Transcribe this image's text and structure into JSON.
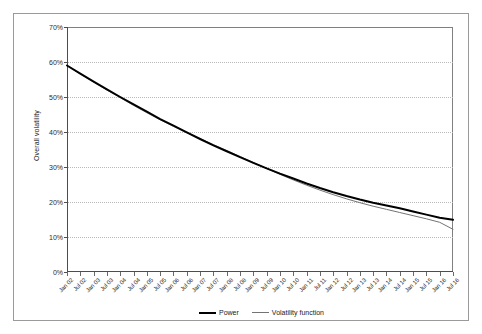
{
  "chart_data": {
    "type": "line",
    "title": "",
    "xlabel": "",
    "ylabel": "Overall volatility",
    "ylim": [
      0,
      0.7
    ],
    "ytick_labels": [
      "0%",
      "10%",
      "20%",
      "30%",
      "40%",
      "50%",
      "60%",
      "70%"
    ],
    "ytick_values": [
      0,
      10,
      20,
      30,
      40,
      50,
      60,
      70
    ],
    "grid": true,
    "legend_position": "bottom-center",
    "categories": [
      "Jan 02",
      "Jul 02",
      "Jan 03",
      "Jul 03",
      "Jan 04",
      "Jul 04",
      "Jan 05",
      "Jul 05",
      "Jan 06",
      "Jul 06",
      "Jan 07",
      "Jul 07",
      "Jan 08",
      "Jul 08",
      "Jan 09",
      "Jul 09",
      "Jan 10",
      "Jul 10",
      "Jan 11",
      "Jul 11",
      "Jan 12",
      "Jul 12",
      "Jan 13",
      "Jul 13",
      "Jan 14",
      "Jul 14",
      "Jan 15",
      "Jul 15",
      "Jan 16",
      "Jul 16"
    ],
    "series": [
      {
        "name": "Power",
        "color": "#000000",
        "width": 2,
        "values": [
          59.0,
          56.7,
          54.4,
          52.2,
          50.0,
          47.9,
          45.8,
          43.7,
          41.8,
          39.9,
          38.0,
          36.2,
          34.5,
          32.8,
          31.2,
          29.6,
          28.1,
          26.7,
          25.3,
          24.0,
          22.8,
          21.7,
          20.7,
          19.8,
          19.0,
          18.2,
          17.3,
          16.4,
          15.5,
          14.9
        ]
      },
      {
        "name": "Volatility function",
        "color": "#737373",
        "width": 1,
        "values": [
          59.0,
          56.6,
          54.3,
          52.0,
          49.8,
          47.6,
          45.5,
          43.5,
          41.6,
          39.8,
          38.1,
          36.4,
          34.7,
          33.0,
          31.3,
          29.6,
          27.9,
          26.3,
          24.8,
          23.4,
          22.1,
          20.9,
          19.8,
          18.8,
          17.9,
          17.0,
          16.1,
          15.2,
          14.2,
          12.2
        ]
      }
    ]
  },
  "legend": {
    "entries": [
      {
        "label": "Power"
      },
      {
        "label": "Volatility function"
      }
    ]
  }
}
